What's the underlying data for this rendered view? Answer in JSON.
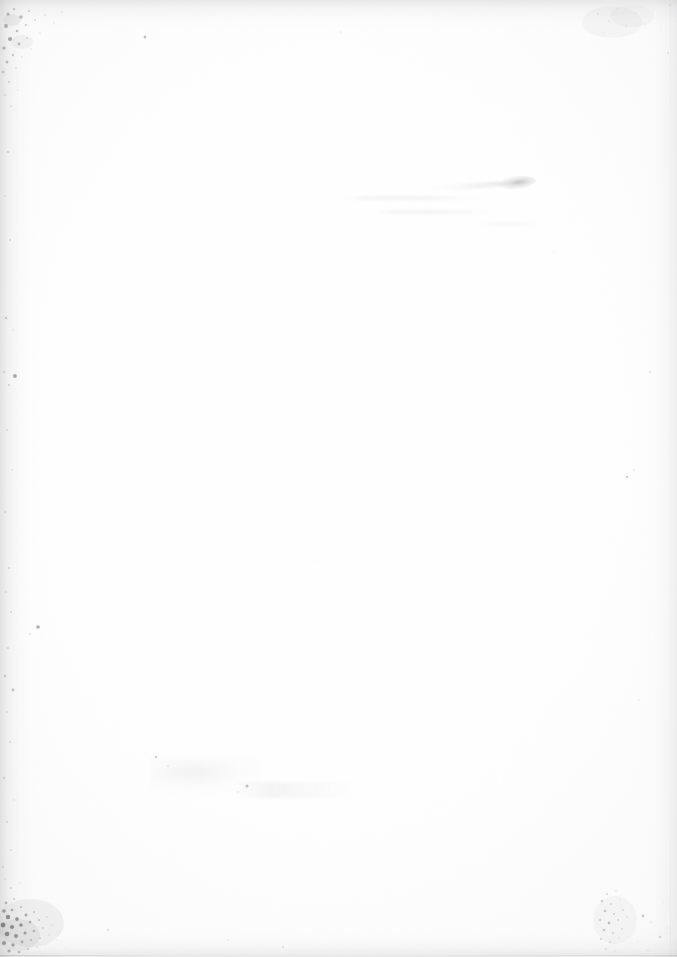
{
  "document": {
    "kind": "scanned-page",
    "page_content": "",
    "page_description": "Blank page from a scanned book — no printed text, headings, figures or page number visible.",
    "text_present": "none",
    "width_px": 677,
    "height_px": 957
  },
  "paper": {
    "base_color": "#fefefe",
    "tone_color": "#fbfbfb",
    "edge_shadow_color": "#9a9a9e",
    "speckle_color": "#6b6b70",
    "smudge_color": "#78787c",
    "bleed_color": "#e8e8eb"
  },
  "artifacts": {
    "items": [
      {
        "name": "top-left-foxing-cluster",
        "label": "Dense age-spot speckling, upper-left corner"
      },
      {
        "name": "bottom-left-foxing-cluster",
        "label": "Dense dark foxing speckle, lower-left corner"
      },
      {
        "name": "bottom-right-foxing-cluster",
        "label": "Light foxing speckle, lower-right corner"
      },
      {
        "name": "top-right-smudge",
        "label": "Pale gray smudge band, upper-right corner"
      },
      {
        "name": "upper-right-ink-smudge",
        "label": "Small gray ink smudge with tail, upper-right quadrant"
      },
      {
        "name": "bleed-through-lines",
        "label": "Very faint show-through of text from reverse side"
      },
      {
        "name": "left-margin-specks",
        "label": "Scattered isolated dark specks along left margin"
      },
      {
        "name": "lower-center-faint-marks",
        "label": "Faint pale marks in lower-center area"
      },
      {
        "name": "edge-vignette",
        "label": "Scanner edge darkening on all four sides"
      }
    ]
  }
}
